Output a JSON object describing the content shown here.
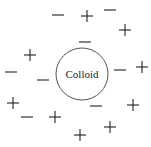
{
  "diagram": {
    "colloid": {
      "label": "Colloid",
      "cx": 82,
      "cy": 74,
      "r": 26,
      "stroke": "#555555"
    },
    "ion_color": "#222222",
    "minus_ions": [
      {
        "x": 58,
        "y": 15
      },
      {
        "x": 110,
        "y": 10
      },
      {
        "x": 85,
        "y": 42
      },
      {
        "x": 11,
        "y": 72
      },
      {
        "x": 43,
        "y": 80
      },
      {
        "x": 120,
        "y": 70
      },
      {
        "x": 96,
        "y": 106
      },
      {
        "x": 27,
        "y": 117
      }
    ],
    "plus_ions": [
      {
        "x": 87,
        "y": 16
      },
      {
        "x": 125,
        "y": 30
      },
      {
        "x": 30,
        "y": 55
      },
      {
        "x": 142,
        "y": 67
      },
      {
        "x": 13,
        "y": 103
      },
      {
        "x": 133,
        "y": 105
      },
      {
        "x": 55,
        "y": 117
      },
      {
        "x": 110,
        "y": 127
      },
      {
        "x": 80,
        "y": 135
      }
    ]
  }
}
